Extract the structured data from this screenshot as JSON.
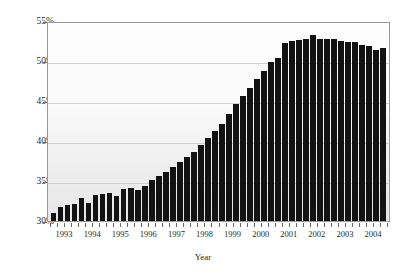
{
  "chart_data": {
    "type": "bar",
    "title": "",
    "subtitle": "",
    "xlabel": "Year",
    "ylabel": "",
    "ylim": [
      30,
      55
    ],
    "ytick_labels": [
      "30%",
      "35%",
      "40%",
      "45%",
      "50%",
      "55%"
    ],
    "ytick_values": [
      30,
      35,
      40,
      45,
      50,
      55
    ],
    "xtick_labels": [
      "1993",
      "1994",
      "1995",
      "1996",
      "1997",
      "1998",
      "1999",
      "2000",
      "2001",
      "2002",
      "2003",
      "2004"
    ],
    "grid": true,
    "legend": "none",
    "bar_color": "#121212",
    "categories": [
      "1993 Q1",
      "1993 Q2",
      "1993 Q3",
      "1993 Q4",
      "1994 Q1",
      "1994 Q2",
      "1994 Q3",
      "1994 Q4",
      "1995 Q1",
      "1995 Q2",
      "1995 Q3",
      "1995 Q4",
      "1996 Q1",
      "1996 Q2",
      "1996 Q3",
      "1996 Q4",
      "1997 Q1",
      "1997 Q2",
      "1997 Q3",
      "1997 Q4",
      "1998 Q1",
      "1998 Q2",
      "1998 Q3",
      "1998 Q4",
      "1999 Q1",
      "1999 Q2",
      "1999 Q3",
      "1999 Q4",
      "2000 Q1",
      "2000 Q2",
      "2000 Q3",
      "2000 Q4",
      "2001 Q1",
      "2001 Q2",
      "2001 Q3",
      "2001 Q4",
      "2002 Q1",
      "2002 Q2",
      "2002 Q3",
      "2002 Q4",
      "2003 Q1",
      "2003 Q2",
      "2003 Q3",
      "2003 Q4",
      "2004 Q1",
      "2004 Q2",
      "2004 Q3",
      "2004 Q4"
    ],
    "values": [
      31.0,
      31.8,
      32.0,
      32.1,
      32.9,
      32.3,
      33.3,
      33.4,
      33.5,
      33.1,
      34.0,
      34.1,
      33.9,
      34.4,
      35.1,
      35.6,
      36.1,
      36.7,
      37.4,
      38.0,
      38.6,
      39.5,
      40.4,
      41.2,
      42.1,
      43.4,
      44.6,
      45.6,
      46.6,
      47.8,
      48.8,
      49.9,
      50.4,
      52.3,
      52.5,
      52.6,
      52.7,
      53.3,
      52.7,
      52.8,
      52.8,
      52.5,
      52.4,
      52.4,
      52.0,
      51.9,
      51.4,
      51.6
    ]
  }
}
